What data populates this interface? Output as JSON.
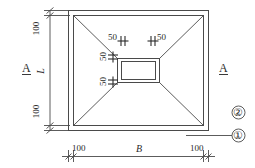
{
  "drawing": {
    "title": "Foundation Footing Plan",
    "line_color": "#4a4a4a",
    "text_color": "#2b2b2b",
    "background": "#ffffff"
  },
  "section_marks": {
    "left": "A",
    "right": "A"
  },
  "dimensions": {
    "top_left_vertical": "100",
    "bottom_left_vertical": "100",
    "left_overall": "L",
    "bottom_left": "100",
    "bottom_center": "B",
    "bottom_right": "100",
    "pedestal_top_left": "50",
    "pedestal_top_right": "50",
    "pedestal_side_upper": "50",
    "pedestal_side_lower": "50"
  },
  "level_marks": {
    "upper": "②",
    "lower": "①"
  }
}
